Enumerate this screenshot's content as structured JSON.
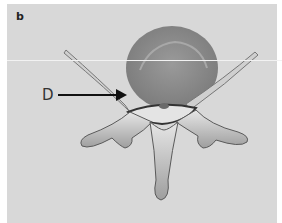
{
  "figure": {
    "panel_label": "b",
    "callout_label": "D",
    "colors": {
      "background": "#d8d8d8",
      "body": "#8f8f8f",
      "bone": "#b8b8b8",
      "outline": "#5a5a5a"
    }
  }
}
